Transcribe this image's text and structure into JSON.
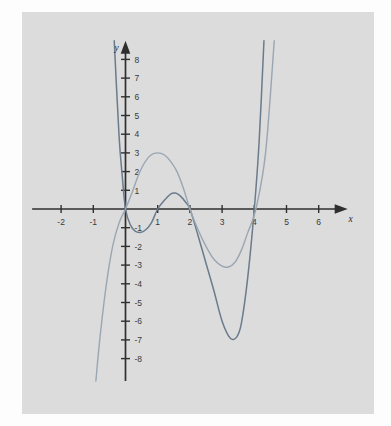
{
  "figure": {
    "background_color": "#fdfdfd",
    "panel_color": "#dcdcdc",
    "axis_color": "#2f2f2f"
  },
  "chart_data": {
    "type": "line",
    "title": "",
    "subtitle": "",
    "xlabel": "x",
    "ylabel": "y",
    "xlim": [
      -2.9,
      6.9
    ],
    "ylim": [
      -9.2,
      9.0
    ],
    "grid": false,
    "legend_position": "none",
    "x_ticks": [
      -2,
      -1,
      1,
      2,
      3,
      4,
      5,
      6
    ],
    "x_tick_labels": [
      "-2",
      "-1",
      "1",
      "2",
      "3",
      "4",
      "5",
      "6"
    ],
    "y_ticks": [
      8,
      7,
      6,
      5,
      4,
      3,
      2,
      1,
      -1,
      -2,
      -3,
      -4,
      -5,
      -6,
      -7,
      -8
    ],
    "y_tick_labels": [
      "8",
      "7",
      "6",
      "5",
      "4",
      "3",
      "2",
      "1",
      "-1",
      "-2",
      "-3",
      "-4",
      "-5",
      "-6",
      "-7",
      "-8"
    ],
    "annotations": [],
    "series": [
      {
        "name": "dark-curve",
        "color": "#6a7b8c",
        "stroke_width": 1.5,
        "roots": [
          0,
          1,
          2,
          4
        ],
        "local_minima": [
          {
            "x": 0.45,
            "y": -1.25
          },
          {
            "x": 3.25,
            "y": -6.9
          }
        ],
        "local_maxima": [
          {
            "x": 1.55,
            "y": 0.85
          }
        ],
        "points": [
          {
            "x": -0.35,
            "y": 9.0
          },
          {
            "x": -0.2,
            "y": 3.9
          },
          {
            "x": -0.1,
            "y": 1.75
          },
          {
            "x": 0.0,
            "y": 0.0
          },
          {
            "x": 0.15,
            "y": -0.85
          },
          {
            "x": 0.3,
            "y": -1.18
          },
          {
            "x": 0.45,
            "y": -1.25
          },
          {
            "x": 0.6,
            "y": -1.15
          },
          {
            "x": 0.8,
            "y": -0.75
          },
          {
            "x": 1.0,
            "y": 0.0
          },
          {
            "x": 1.2,
            "y": 0.45
          },
          {
            "x": 1.4,
            "y": 0.8
          },
          {
            "x": 1.55,
            "y": 0.85
          },
          {
            "x": 1.7,
            "y": 0.7
          },
          {
            "x": 1.85,
            "y": 0.4
          },
          {
            "x": 2.0,
            "y": 0.0
          },
          {
            "x": 2.25,
            "y": -1.4
          },
          {
            "x": 2.5,
            "y": -2.9
          },
          {
            "x": 2.75,
            "y": -4.4
          },
          {
            "x": 3.0,
            "y": -6.0
          },
          {
            "x": 3.25,
            "y": -6.9
          },
          {
            "x": 3.45,
            "y": -6.85
          },
          {
            "x": 3.6,
            "y": -6.1
          },
          {
            "x": 3.8,
            "y": -3.6
          },
          {
            "x": 4.0,
            "y": 0.0
          },
          {
            "x": 4.15,
            "y": 3.6
          },
          {
            "x": 4.3,
            "y": 9.0
          }
        ]
      },
      {
        "name": "light-curve",
        "color": "#9aa6b2",
        "stroke_width": 1.4,
        "roots": [
          0,
          2,
          4
        ],
        "local_minima": [
          {
            "x": 3.2,
            "y": -3.1
          }
        ],
        "local_maxima": [
          {
            "x": 1.0,
            "y": 3.0
          }
        ],
        "points": [
          {
            "x": -0.92,
            "y": -9.2
          },
          {
            "x": -0.8,
            "y": -7.0
          },
          {
            "x": -0.6,
            "y": -4.1
          },
          {
            "x": -0.4,
            "y": -2.0
          },
          {
            "x": -0.2,
            "y": -0.75
          },
          {
            "x": 0.0,
            "y": 0.0
          },
          {
            "x": 0.2,
            "y": 0.85
          },
          {
            "x": 0.4,
            "y": 1.8
          },
          {
            "x": 0.6,
            "y": 2.5
          },
          {
            "x": 0.8,
            "y": 2.9
          },
          {
            "x": 1.0,
            "y": 3.0
          },
          {
            "x": 1.2,
            "y": 2.9
          },
          {
            "x": 1.4,
            "y": 2.55
          },
          {
            "x": 1.6,
            "y": 2.0
          },
          {
            "x": 1.8,
            "y": 1.1
          },
          {
            "x": 2.0,
            "y": 0.0
          },
          {
            "x": 2.25,
            "y": -1.1
          },
          {
            "x": 2.5,
            "y": -2.0
          },
          {
            "x": 2.75,
            "y": -2.7
          },
          {
            "x": 3.0,
            "y": -3.05
          },
          {
            "x": 3.2,
            "y": -3.1
          },
          {
            "x": 3.4,
            "y": -2.85
          },
          {
            "x": 3.6,
            "y": -2.2
          },
          {
            "x": 3.8,
            "y": -1.25
          },
          {
            "x": 4.05,
            "y": 0.0
          },
          {
            "x": 4.35,
            "y": 3.0
          },
          {
            "x": 4.62,
            "y": 9.0
          }
        ]
      }
    ]
  }
}
